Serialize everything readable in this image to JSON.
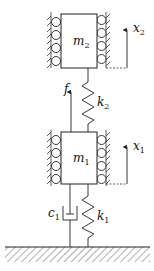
{
  "diagram": {
    "type": "two-mass spring-damper system",
    "colors": {
      "line": "#222222",
      "background": "#ffffff"
    },
    "masses": [
      {
        "id": "m2",
        "label": "m",
        "subscript": "2"
      },
      {
        "id": "m1",
        "label": "m",
        "subscript": "1"
      }
    ],
    "springs": [
      {
        "id": "k2",
        "label": "k",
        "subscript": "2",
        "connects": "m1-m2"
      },
      {
        "id": "k1",
        "label": "k",
        "subscript": "1",
        "connects": "ground-m1"
      }
    ],
    "dampers": [
      {
        "id": "c1",
        "label": "c",
        "subscript": "1",
        "connects": "ground-m1"
      }
    ],
    "force": {
      "label": "f",
      "acts_on": "m1",
      "direction": "up"
    },
    "displacements": [
      {
        "id": "x2",
        "label": "x",
        "subscript": "2",
        "mass": "m2"
      },
      {
        "id": "x1",
        "label": "x",
        "subscript": "1",
        "mass": "m1"
      }
    ],
    "ground": {
      "label": ""
    }
  }
}
